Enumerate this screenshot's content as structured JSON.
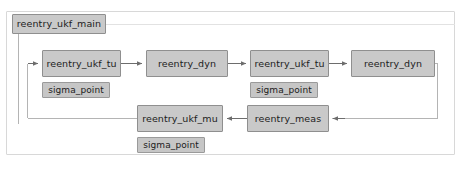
{
  "diagram": {
    "type": "simulink-block-diagram",
    "title": "reentry_ukf_main",
    "canvas": {
      "width": 470,
      "height": 170
    },
    "colors": {
      "block_fill": "#c9c9c9",
      "block_border": "#8f8f8f",
      "container_border": "#d8d8d8",
      "line": "#b4b4b4",
      "background": "#ffffff",
      "text": "#1c1c1c"
    },
    "blocks": [
      {
        "id": "title",
        "label": "reentry_ukf_main",
        "kind": "model-title"
      },
      {
        "id": "tu1",
        "label": "reentry_ukf_tu",
        "kind": "subsystem"
      },
      {
        "id": "tu1_sigma",
        "label": "sigma_point",
        "kind": "sublabel"
      },
      {
        "id": "dyn1",
        "label": "reentry_dyn",
        "kind": "subsystem"
      },
      {
        "id": "tu2",
        "label": "reentry_ukf_tu",
        "kind": "subsystem"
      },
      {
        "id": "tu2_sigma",
        "label": "sigma_point",
        "kind": "sublabel"
      },
      {
        "id": "dyn2",
        "label": "reentry_dyn",
        "kind": "subsystem"
      },
      {
        "id": "mu",
        "label": "reentry_ukf_mu",
        "kind": "subsystem"
      },
      {
        "id": "mu_sigma",
        "label": "sigma_point",
        "kind": "sublabel"
      },
      {
        "id": "meas",
        "label": "reentry_meas",
        "kind": "subsystem"
      }
    ],
    "connections": [
      {
        "from": "feedback-loop",
        "to": "tu1",
        "arrow": true
      },
      {
        "from": "tu1",
        "to": "dyn1",
        "arrow": true
      },
      {
        "from": "dyn1",
        "to": "tu2",
        "arrow": true
      },
      {
        "from": "tu2",
        "to": "dyn2",
        "arrow": true
      },
      {
        "from": "dyn2",
        "to": "meas",
        "arrow": true
      },
      {
        "from": "meas",
        "to": "mu",
        "arrow": true
      },
      {
        "from": "title",
        "to": "tu1",
        "arrow": false
      },
      {
        "from": "mu",
        "to": "tu1",
        "arrow": false
      }
    ]
  }
}
